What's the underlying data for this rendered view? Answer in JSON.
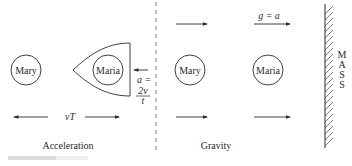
{
  "left_panel": {
    "title": "Acceleration",
    "person_a": "Mary",
    "person_b": "Maria",
    "distance_label": "vT",
    "acceleration_label": "a =",
    "acceleration_num": "2v",
    "acceleration_den": "t"
  },
  "right_panel": {
    "title": "Gravity",
    "person_a": "Mary",
    "person_b": "Maria",
    "field_label": "g = a",
    "mass_letters": [
      "M",
      "A",
      "S",
      "S"
    ]
  },
  "colors": {
    "stroke": "#2a2a2a",
    "divider": "#555555",
    "background": "#ffffff"
  }
}
